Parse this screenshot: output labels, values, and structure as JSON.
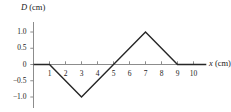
{
  "chart_data": {
    "type": "line",
    "title": "",
    "xlabel": "x (cm)",
    "ylabel": "D (cm)",
    "xlabel_var": "x",
    "xlabel_unit": "(cm)",
    "ylabel_var": "D",
    "ylabel_unit": "(cm)",
    "xlim": [
      0,
      10.8
    ],
    "ylim": [
      -1.25,
      1.25
    ],
    "grid": false,
    "legend": false,
    "x": [
      0,
      1,
      3,
      5,
      7,
      9,
      10.8
    ],
    "y": [
      0,
      0,
      -1.0,
      0,
      1.0,
      0,
      0
    ],
    "points": [
      {
        "x": 0,
        "y": 0
      },
      {
        "x": 1,
        "y": 0
      },
      {
        "x": 3,
        "y": -1.0
      },
      {
        "x": 5,
        "y": 0
      },
      {
        "x": 7,
        "y": 1.0
      },
      {
        "x": 9,
        "y": 0
      },
      {
        "x": 10.8,
        "y": 0
      }
    ],
    "xticks": [
      1,
      2,
      3,
      4,
      5,
      6,
      7,
      8,
      9,
      10
    ],
    "xtick_labels": [
      "1",
      "2",
      "3",
      "4",
      "5",
      "6",
      "7",
      "8",
      "9",
      "10"
    ],
    "yticks": [
      1.0,
      0.5,
      0,
      -0.5,
      -1.0
    ],
    "ytick_labels": [
      "1.0",
      "0.5",
      "0",
      "−0.5",
      "−1.0"
    ],
    "series_color": "#262626",
    "axis_color": "#8c8c8c",
    "background": "#ffffff"
  }
}
